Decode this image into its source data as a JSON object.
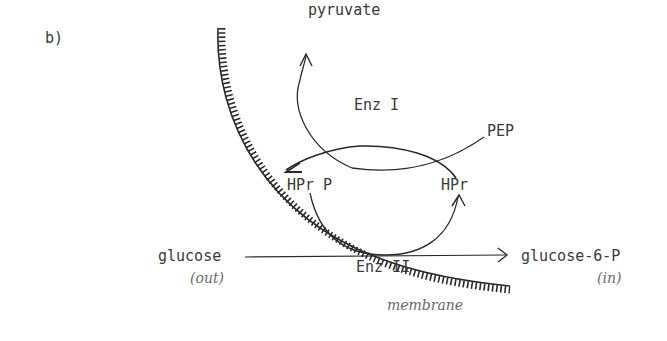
{
  "figure": {
    "panel_label": "b)",
    "labels": {
      "pyruvate": "pyruvate",
      "enz1": "Enz I",
      "pep": "PEP",
      "hpr_p": "HPr P",
      "hpr": "HPr",
      "glucose": "glucose",
      "out": "(out)",
      "enz2": "Enz II",
      "glucose6p": "glucose-6-P",
      "in": "(in)",
      "membrane": "membrane"
    },
    "colors": {
      "ink": "#2a2a2a",
      "text": "#3a3a3a",
      "italic_text": "#6a6a6a",
      "background": "#ffffff"
    }
  }
}
